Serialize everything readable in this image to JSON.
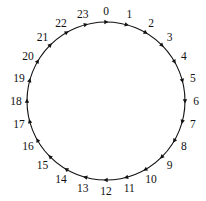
{
  "diagram": {
    "type": "cycle",
    "direction": "clockwise",
    "center": [
      106,
      101
    ],
    "radius": 79,
    "label_radius": 90,
    "stroke_color": "#111111",
    "nodes": [
      {
        "label": "0"
      },
      {
        "label": "1"
      },
      {
        "label": "2"
      },
      {
        "label": "3"
      },
      {
        "label": "4"
      },
      {
        "label": "5"
      },
      {
        "label": "6"
      },
      {
        "label": "7"
      },
      {
        "label": "8"
      },
      {
        "label": "9"
      },
      {
        "label": "10"
      },
      {
        "label": "11"
      },
      {
        "label": "12"
      },
      {
        "label": "13"
      },
      {
        "label": "14"
      },
      {
        "label": "15"
      },
      {
        "label": "16"
      },
      {
        "label": "17"
      },
      {
        "label": "18"
      },
      {
        "label": "19"
      },
      {
        "label": "20"
      },
      {
        "label": "21"
      },
      {
        "label": "22"
      },
      {
        "label": "23"
      }
    ]
  }
}
